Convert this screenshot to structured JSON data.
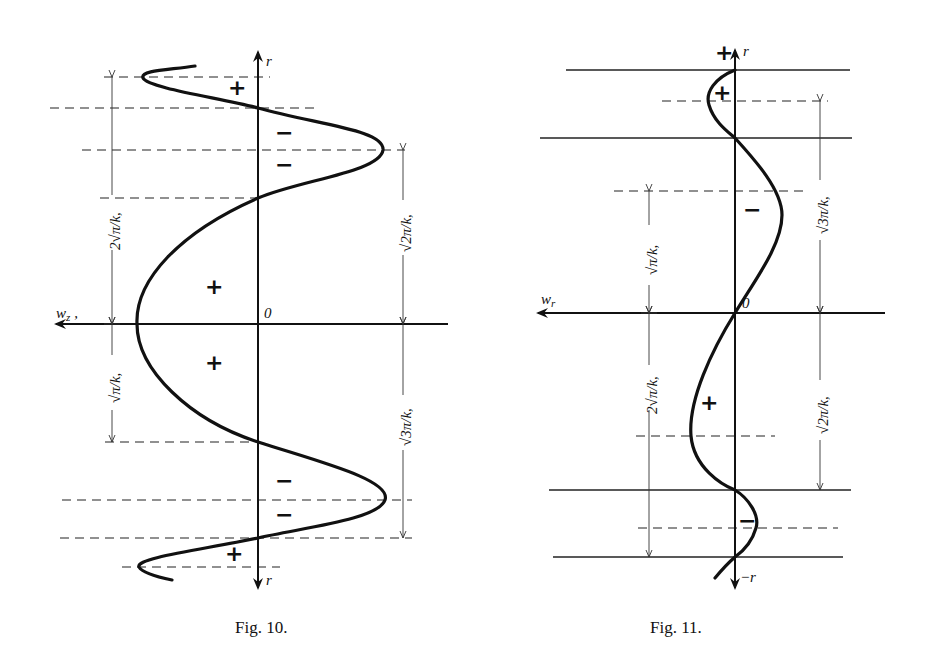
{
  "figures": [
    {
      "id": "fig10",
      "caption": "Fig. 10.",
      "axes": {
        "vertical_label_top": "r",
        "vertical_label_bottom": "r",
        "horizontal_label": "w_z ,",
        "origin_label": "0"
      },
      "signs": [
        {
          "label": "+",
          "region": "top-left"
        },
        {
          "label": "−",
          "region": "upper-right-1"
        },
        {
          "label": "−",
          "region": "upper-right-2"
        },
        {
          "label": "+",
          "region": "middle-left-upper"
        },
        {
          "label": "+",
          "region": "middle-left-lower"
        },
        {
          "label": "−",
          "region": "lower-right-1"
        },
        {
          "label": "−",
          "region": "lower-right-2"
        },
        {
          "label": "+",
          "region": "bottom-left"
        }
      ],
      "dimensions": [
        {
          "label": "2√(π/k)",
          "side": "left",
          "span": "upper"
        },
        {
          "label": "√(π/k)",
          "side": "left",
          "span": "lower"
        },
        {
          "label": "√(2π/k)",
          "side": "right",
          "span": "upper"
        },
        {
          "label": "√(3π/k)",
          "side": "right",
          "span": "lower"
        }
      ]
    },
    {
      "id": "fig11",
      "caption": "Fig. 11.",
      "axes": {
        "vertical_label_top": "r",
        "vertical_label_bottom": "−r",
        "horizontal_label": "w_r",
        "origin_label": "0",
        "top_sign": "+"
      },
      "signs": [
        {
          "label": "+",
          "region": "top-left"
        },
        {
          "label": "−",
          "region": "upper-right"
        },
        {
          "label": "+",
          "region": "lower-left"
        },
        {
          "label": "−",
          "region": "bottom-right"
        }
      ],
      "dimensions": [
        {
          "label": "√(π/k)",
          "side": "left",
          "span": "upper"
        },
        {
          "label": "2√(π/k)",
          "side": "left",
          "span": "lower"
        },
        {
          "label": "√(3π/k)",
          "side": "right",
          "span": "upper"
        },
        {
          "label": "√(2π/k)",
          "side": "right",
          "span": "lower"
        }
      ]
    }
  ],
  "text": {
    "r": "r",
    "neg_r": "−r",
    "origin": "0",
    "wz": "w",
    "wz_sub": "z",
    "wz_comma": ",",
    "wr": "w",
    "wr_sub": "r",
    "plus": "+",
    "minus": "−",
    "two": "2",
    "pi": "π",
    "two_pi": "2π",
    "three_pi": "3π",
    "k": "k",
    "caption10": "Fig. 10.",
    "caption11": "Fig. 11."
  }
}
